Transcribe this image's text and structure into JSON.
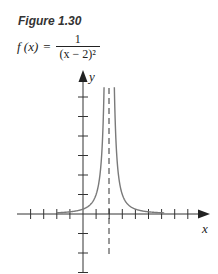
{
  "figure": {
    "label": "Figure 1.30",
    "formula": {
      "lhs": "f (x)",
      "eq": "=",
      "numerator": "1",
      "denominator": "(x − 2)²"
    }
  },
  "chart_data": {
    "type": "line",
    "xlabel": "x",
    "ylabel": "y",
    "function": "1/(x-2)^2",
    "vertical_asymptote": {
      "x": 2,
      "style": "dashed"
    },
    "horizontal_asymptote": {
      "y": 0
    },
    "xlim": [
      -4,
      9
    ],
    "ylim": [
      -3,
      7
    ],
    "x_ticks": [
      -4,
      -3,
      -2,
      -1,
      1,
      2,
      3,
      4,
      5,
      6,
      7,
      8
    ],
    "y_ticks": [
      -3,
      -2,
      -1,
      1,
      2,
      3,
      4,
      5,
      6
    ],
    "tick_labels_shown": false,
    "grid": false,
    "legend": null,
    "curve_color": "#7a7a7a",
    "axis_color": "#333333"
  }
}
